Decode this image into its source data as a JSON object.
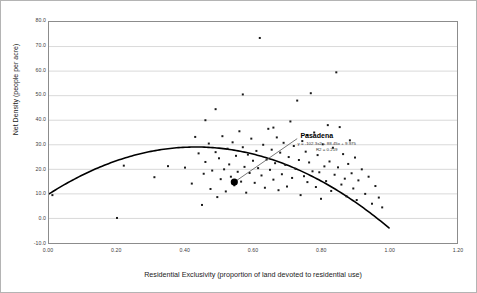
{
  "chart_data": {
    "type": "scatter",
    "title": "",
    "xlabel": "Residential Exclusivity (proportion of land devoted to residential use)",
    "ylabel": "Net Density (people per acre)",
    "xlim": [
      0.0,
      1.2
    ],
    "ylim": [
      -10.0,
      80.0
    ],
    "grid": "horizontal",
    "legend": "none",
    "xticks": [
      "0.00",
      "0.20",
      "0.40",
      "0.60",
      "0.80",
      "1.00",
      "1.20"
    ],
    "xtick_values": [
      0.0,
      0.2,
      0.4,
      0.6,
      0.8,
      1.0,
      1.2
    ],
    "yticks": [
      "80.0",
      "70.0",
      "60.0",
      "50.0",
      "40.0",
      "30.0",
      "20.0",
      "10.0",
      "0.0",
      "-10.0"
    ],
    "ytick_values": [
      80,
      70,
      60,
      50,
      40,
      30,
      20,
      10,
      0,
      -10
    ],
    "marker": "small black square",
    "points": [
      [
        0.01,
        9.5
      ],
      [
        0.2,
        0.2
      ],
      [
        0.22,
        21.5
      ],
      [
        0.31,
        16.8
      ],
      [
        0.35,
        21.3
      ],
      [
        0.4,
        20.7
      ],
      [
        0.42,
        14.2
      ],
      [
        0.43,
        33.2
      ],
      [
        0.44,
        26.5
      ],
      [
        0.45,
        5.5
      ],
      [
        0.455,
        18.2
      ],
      [
        0.46,
        23.0
      ],
      [
        0.47,
        30.5
      ],
      [
        0.475,
        12.0
      ],
      [
        0.48,
        19.5
      ],
      [
        0.49,
        27.0
      ],
      [
        0.495,
        8.7
      ],
      [
        0.5,
        24.5
      ],
      [
        0.505,
        16.0
      ],
      [
        0.51,
        33.5
      ],
      [
        0.515,
        20.0
      ],
      [
        0.52,
        11.0
      ],
      [
        0.525,
        28.4
      ],
      [
        0.53,
        22.0
      ],
      [
        0.535,
        17.0
      ],
      [
        0.54,
        31.0
      ],
      [
        0.545,
        13.5
      ],
      [
        0.55,
        25.5
      ],
      [
        0.555,
        19.0
      ],
      [
        0.56,
        35.5
      ],
      [
        0.565,
        15.0
      ],
      [
        0.57,
        29.0
      ],
      [
        0.575,
        21.0
      ],
      [
        0.58,
        10.5
      ],
      [
        0.585,
        26.0
      ],
      [
        0.59,
        18.5
      ],
      [
        0.595,
        32.5
      ],
      [
        0.6,
        23.5
      ],
      [
        0.605,
        14.5
      ],
      [
        0.61,
        27.5
      ],
      [
        0.615,
        20.5
      ],
      [
        0.62,
        73.5
      ],
      [
        0.625,
        17.5
      ],
      [
        0.63,
        30.0
      ],
      [
        0.635,
        12.5
      ],
      [
        0.64,
        24.0
      ],
      [
        0.645,
        36.5
      ],
      [
        0.65,
        19.8
      ],
      [
        0.655,
        28.0
      ],
      [
        0.66,
        15.8
      ],
      [
        0.665,
        22.5
      ],
      [
        0.67,
        33.0
      ],
      [
        0.675,
        11.5
      ],
      [
        0.68,
        26.8
      ],
      [
        0.685,
        18.0
      ],
      [
        0.69,
        30.8
      ],
      [
        0.695,
        21.8
      ],
      [
        0.7,
        13.0
      ],
      [
        0.705,
        25.0
      ],
      [
        0.71,
        39.5
      ],
      [
        0.715,
        16.5
      ],
      [
        0.72,
        29.5
      ],
      [
        0.725,
        20.2
      ],
      [
        0.73,
        48.0
      ],
      [
        0.735,
        23.8
      ],
      [
        0.74,
        9.5
      ],
      [
        0.745,
        31.5
      ],
      [
        0.75,
        17.2
      ],
      [
        0.755,
        27.2
      ],
      [
        0.76,
        14.8
      ],
      [
        0.765,
        22.8
      ],
      [
        0.77,
        51.0
      ],
      [
        0.775,
        19.2
      ],
      [
        0.78,
        35.0
      ],
      [
        0.785,
        12.8
      ],
      [
        0.79,
        25.8
      ],
      [
        0.795,
        18.8
      ],
      [
        0.8,
        8.0
      ],
      [
        0.805,
        30.2
      ],
      [
        0.81,
        21.2
      ],
      [
        0.815,
        15.2
      ],
      [
        0.82,
        38.0
      ],
      [
        0.825,
        23.2
      ],
      [
        0.83,
        11.2
      ],
      [
        0.835,
        28.8
      ],
      [
        0.84,
        17.8
      ],
      [
        0.845,
        59.5
      ],
      [
        0.85,
        20.8
      ],
      [
        0.855,
        37.2
      ],
      [
        0.86,
        13.8
      ],
      [
        0.865,
        26.2
      ],
      [
        0.87,
        16.2
      ],
      [
        0.875,
        9.0
      ],
      [
        0.88,
        22.2
      ],
      [
        0.885,
        31.8
      ],
      [
        0.89,
        18.4
      ],
      [
        0.895,
        12.2
      ],
      [
        0.9,
        24.8
      ],
      [
        0.905,
        7.5
      ],
      [
        0.91,
        15.5
      ],
      [
        0.92,
        20.0
      ],
      [
        0.93,
        10.0
      ],
      [
        0.94,
        17.0
      ],
      [
        0.95,
        6.0
      ],
      [
        0.96,
        13.2
      ],
      [
        0.97,
        8.5
      ],
      [
        0.98,
        4.5
      ],
      [
        0.46,
        40.0
      ],
      [
        0.49,
        44.5
      ],
      [
        0.57,
        50.5
      ],
      [
        0.76,
        34.0
      ],
      [
        0.66,
        37.0
      ]
    ],
    "highlight_point": {
      "label": "Pasadena",
      "x": 0.545,
      "y": 14.8,
      "marker": "large filled circle",
      "label_x": 0.73,
      "label_y": 32.5,
      "color": "#000000"
    },
    "trendline": {
      "kind": "polynomial",
      "order": 2,
      "coefficients": [
        -102.3,
        88.45,
        9.975
      ],
      "equation": "y = -102.3x2 + 88.45x + 9.975",
      "r_squared_label": "R2 = 0.219",
      "r_squared": 0.219,
      "x_start": 0.0,
      "x_end": 1.0,
      "color": "#000000",
      "annotation_x": 0.78,
      "annotation_y": 30.5
    },
    "colors": {
      "point": "#1a1a1a",
      "gridline": "#c8c8c8",
      "axis": "#8c8c8c",
      "text": "#333333",
      "frame": "#b4b4b4"
    }
  }
}
